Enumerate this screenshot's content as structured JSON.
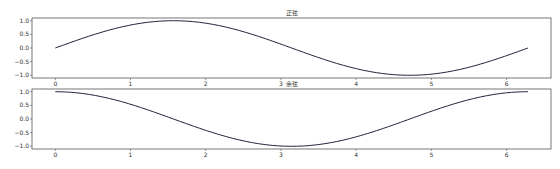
{
  "chart_data": [
    {
      "type": "line",
      "title": "正弦",
      "xlabel": "",
      "ylabel": "",
      "xlim": [
        -0.31,
        6.59
      ],
      "ylim": [
        -1.1,
        1.1
      ],
      "grid": false,
      "xticks": [
        0,
        1,
        2,
        3,
        4,
        5,
        6
      ],
      "yticks": [
        1.0,
        0.5,
        0.0,
        -0.5,
        -1.0
      ],
      "ytick_labels": [
        "1.0",
        "0.5",
        "0.0",
        "−0.5",
        "−1.0"
      ],
      "series": [
        {
          "name": "sin(x)",
          "function": "sin",
          "x_range": [
            0,
            6.283
          ],
          "color": "#1f1f3a"
        }
      ]
    },
    {
      "type": "line",
      "title": "余弦",
      "xlabel": "",
      "ylabel": "",
      "xlim": [
        -0.31,
        6.59
      ],
      "ylim": [
        -1.1,
        1.1
      ],
      "grid": false,
      "xticks": [
        0,
        1,
        2,
        3,
        4,
        5,
        6
      ],
      "yticks": [
        1.0,
        0.5,
        0.0,
        -0.5,
        -1.0
      ],
      "ytick_labels": [
        "1.0",
        "0.5",
        "0.0",
        "−0.5",
        "−1.0"
      ],
      "series": [
        {
          "name": "cos(x)",
          "function": "cos",
          "x_range": [
            0,
            6.283
          ],
          "color": "#1f1f3a"
        }
      ]
    }
  ],
  "axes_layout": [
    {
      "left": 32,
      "top": 18,
      "right": 551,
      "bottom": 78
    },
    {
      "left": 32,
      "top": 89,
      "right": 551,
      "bottom": 149
    }
  ]
}
